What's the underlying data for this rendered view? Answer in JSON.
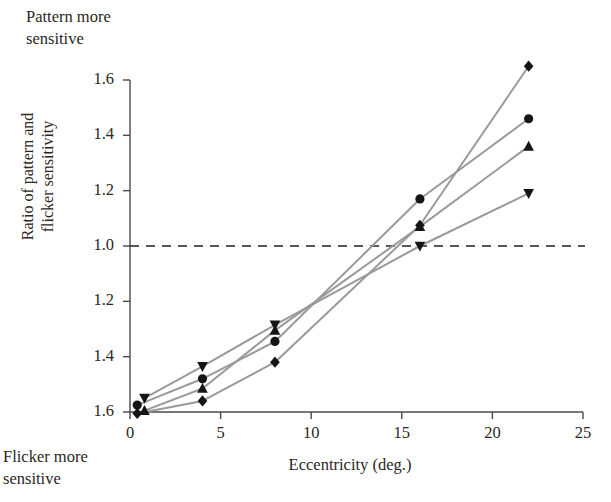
{
  "annotations": {
    "top_note": "Pattern more\nsensitive",
    "bottom_note": "Flicker more\nsensitive"
  },
  "chart_data": {
    "type": "line",
    "title": "",
    "subtitle": "",
    "xlabel": "Eccentricity (deg.)",
    "ylabel": "Ratio of pattern and\nflicker sensitivity",
    "xlim": [
      0,
      25
    ],
    "ylim_display": "symmetric ratio axis: 1.6 (flicker) at bottom through 1.0 to 1.6 (pattern) at top",
    "xticks": [
      0,
      5,
      10,
      15,
      20,
      25
    ],
    "xtick_labels": [
      "0",
      "5",
      "10",
      "15",
      "20",
      "25"
    ],
    "ytick_labels": [
      "1.6",
      "1.4",
      "1.2",
      "1.0",
      "1.2",
      "1.4",
      "1.6"
    ],
    "ytick_values": [
      1.6,
      1.4,
      1.2,
      1.0,
      0.8,
      0.6,
      0.4
    ],
    "grid": false,
    "legend": "none",
    "reference_line": {
      "y": 1.0,
      "style": "dashed",
      "label": "1.0",
      "color": "#222222"
    },
    "line_color": "#9a9a9a",
    "marker_color": "#151515",
    "series": [
      {
        "name": "observer-1",
        "marker": "diamond",
        "x": [
          0.4,
          4.0,
          8.0,
          16.0,
          22.0
        ],
        "y": [
          0.395,
          0.44,
          0.58,
          1.075,
          1.65
        ]
      },
      {
        "name": "observer-2",
        "marker": "circle",
        "x": [
          0.4,
          4.0,
          8.0,
          16.0,
          22.0
        ],
        "y": [
          0.425,
          0.52,
          0.655,
          1.17,
          1.46
        ]
      },
      {
        "name": "observer-3",
        "marker": "up-triangle",
        "x": [
          0.8,
          4.0,
          8.0,
          16.0,
          22.0
        ],
        "y": [
          0.405,
          0.485,
          0.695,
          1.07,
          1.36
        ]
      },
      {
        "name": "observer-4",
        "marker": "down-triangle",
        "x": [
          0.8,
          4.0,
          8.0,
          16.0,
          22.0
        ],
        "y": [
          0.45,
          0.565,
          0.715,
          1.0,
          1.19
        ]
      }
    ]
  }
}
